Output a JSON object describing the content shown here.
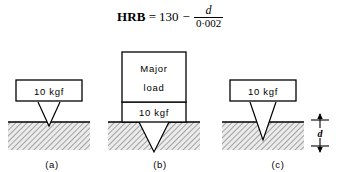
{
  "figure": {
    "type": "rockwell-hardness-test-diagram",
    "formula": {
      "lhs": "HRB",
      "equals": "=",
      "constant": "130",
      "operator": "−",
      "numerator": "d",
      "denominator": "0·002"
    },
    "panels": [
      {
        "id": "a",
        "label": "(a)",
        "stage": "minor-load",
        "boxes": [
          {
            "name": "minor-load-box",
            "text": "10 kgf"
          }
        ],
        "indent_depth": "shallow"
      },
      {
        "id": "b",
        "label": "(b)",
        "stage": "major-load",
        "boxes": [
          {
            "name": "major-load-box",
            "text": "Major load",
            "line1": "Major",
            "line2": "load"
          },
          {
            "name": "minor-load-box",
            "text": "10 kgf"
          }
        ],
        "indent_depth": "deep"
      },
      {
        "id": "c",
        "label": "(c)",
        "stage": "recovery-minor-load",
        "boxes": [
          {
            "name": "minor-load-box",
            "text": "10 kgf"
          }
        ],
        "indent_depth": "medium",
        "dimension": {
          "name": "depth-dimension",
          "symbol": "d"
        }
      }
    ],
    "colors": {
      "line": "#000000",
      "hatch": "#555555",
      "specimen_fill": "#e8e8e8",
      "background": "#ffffff"
    }
  }
}
